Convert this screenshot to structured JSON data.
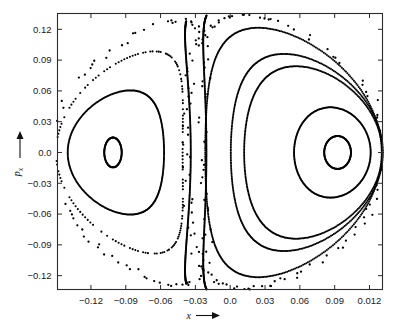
{
  "figure": {
    "type": "scatter-poincare-section",
    "title": "",
    "background_color": "#ffffff",
    "point_color": "#000000",
    "frame_color": "#2b2b2b"
  },
  "axes": {
    "x": {
      "label": "x",
      "label_arrow": "⟶",
      "tick_labels": [
        "−0.12",
        "−0.09",
        "−0.06",
        "−0.03",
        "0.0",
        "0.03",
        "0.06",
        "0.09",
        "0.012"
      ],
      "tick_values": [
        -0.12,
        -0.09,
        -0.06,
        -0.03,
        0.0,
        0.03,
        0.06,
        0.09,
        0.12
      ],
      "min": -0.1488,
      "max": 0.1312
    },
    "y": {
      "label": "p",
      "label_subscript": "x",
      "label_arrow": "↑",
      "tick_labels": [
        "0.12",
        "0.09",
        "0.06",
        "0.03",
        "0.0",
        "−0.03",
        "−0.06",
        "−0.09",
        "−0.12"
      ],
      "tick_values": [
        0.12,
        0.09,
        0.06,
        0.03,
        0.0,
        -0.03,
        -0.06,
        -0.09,
        -0.12
      ],
      "min": -0.1335,
      "max": 0.1354
    }
  },
  "chart_data": {
    "type": "scatter",
    "title": "",
    "xlabel": "x",
    "ylabel": "p_x",
    "xlim": [
      -0.1488,
      0.1312
    ],
    "ylim": [
      -0.1335,
      0.1354
    ],
    "grid": false,
    "legend": "none",
    "fixed_points": [
      {
        "name": "left-elliptic-center",
        "x": -0.101,
        "p": 0.0
      },
      {
        "name": "right-elliptic-center",
        "x": 0.092,
        "p": 0.0
      }
    ],
    "series": [
      {
        "name": "left-inner-island",
        "kind": "closed-curve",
        "style": "dense",
        "center": [
          -0.101,
          0.0
        ],
        "rx": 0.0075,
        "ry": 0.0145,
        "n": 150
      },
      {
        "name": "left-mid-torus",
        "kind": "closed-curve",
        "style": "dense",
        "center": [
          -0.0985,
          0.0
        ],
        "rx": 0.0415,
        "ry": 0.0605,
        "skew": 0.3,
        "n": 330
      },
      {
        "name": "left-outer-torus",
        "kind": "closed-curve",
        "style": "sparse",
        "center": [
          -0.0955,
          0.0
        ],
        "rx": 0.0545,
        "ry": 0.0985,
        "skew": 0.55,
        "n": 185
      },
      {
        "name": "left-stochastic-layer",
        "kind": "closed-curve",
        "style": "scatter",
        "center": [
          -0.0905,
          0.0
        ],
        "rx": 0.0665,
        "ry": 0.129,
        "skew": 0.72,
        "n": 135,
        "jitter": 0.0035
      },
      {
        "name": "separatrix-inner-left-branch",
        "kind": "open-arc",
        "style": "dense",
        "center": [
          -0.011,
          0.0
        ],
        "rx": 0.023,
        "ry": 0.1345,
        "skew": -0.95,
        "n": 300,
        "arc": [
          108,
          252
        ]
      },
      {
        "name": "separatrix-outer-left-branch",
        "kind": "open-arc",
        "style": "dense",
        "center": [
          0.004,
          0.0
        ],
        "rx": 0.0245,
        "ry": 0.1375,
        "skew": -0.8,
        "n": 300,
        "arc": [
          104,
          256
        ]
      },
      {
        "name": "right-outer-torus",
        "kind": "closed-curve",
        "style": "dense",
        "center": [
          0.0545,
          0.0
        ],
        "rx": 0.076,
        "ry": 0.1215,
        "skew": -0.4,
        "n": 420
      },
      {
        "name": "right-second-torus",
        "kind": "closed-curve",
        "style": "dense",
        "center": [
          0.066,
          0.0
        ],
        "rx": 0.0655,
        "ry": 0.096,
        "skew": -0.3,
        "n": 380
      },
      {
        "name": "right-third-torus",
        "kind": "closed-curve",
        "style": "dense",
        "center": [
          0.0715,
          0.0
        ],
        "rx": 0.0595,
        "ry": 0.084,
        "skew": -0.25,
        "n": 360
      },
      {
        "name": "right-inner-torus",
        "kind": "closed-curve",
        "style": "dense",
        "center": [
          0.088,
          0.0
        ],
        "rx": 0.033,
        "ry": 0.044,
        "skew": -0.05,
        "n": 260
      },
      {
        "name": "right-inner-island",
        "kind": "closed-curve",
        "style": "dense",
        "center": [
          0.0925,
          0.0
        ],
        "rx": 0.0115,
        "ry": 0.016,
        "n": 170
      },
      {
        "name": "right-stochastic-layer",
        "kind": "closed-curve",
        "style": "scatter",
        "center": [
          0.049,
          0.0
        ],
        "rx": 0.086,
        "ry": 0.133,
        "skew": -0.45,
        "n": 150,
        "jitter": 0.0035
      }
    ]
  }
}
